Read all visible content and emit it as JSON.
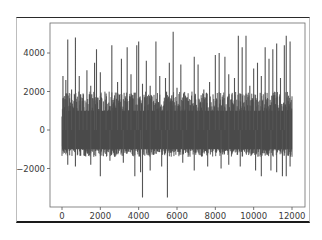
{
  "chart_data": {
    "type": "line",
    "title": "",
    "xlabel": "",
    "ylabel": "",
    "xlim": [
      -500,
      12500
    ],
    "ylim": [
      -3900,
      5400
    ],
    "grid": false,
    "legend": null,
    "x_ticks": [
      0,
      2000,
      4000,
      6000,
      8000,
      10000,
      12000
    ],
    "x_tick_labels": [
      "0",
      "2000",
      "4000",
      "6000",
      "8000",
      "10000",
      "12000"
    ],
    "y_ticks": [
      -2000,
      0,
      2000,
      4000
    ],
    "y_tick_labels": [
      "−2000",
      "0",
      "2000",
      "4000"
    ],
    "series": [
      {
        "name": "signal",
        "color": "#4a4a4a",
        "n_points": 12000,
        "x_range": [
          0,
          12000
        ],
        "typical_band": [
          -1000,
          1000
        ],
        "description": "Dense noisy time series centered near 0, band roughly -1000 to 1000 with frequent positive spikes to 2000-5000 and negative spikes to -2500 / -3500",
        "upper_spikes": [
          {
            "x": 50,
            "y": 2800
          },
          {
            "x": 200,
            "y": 2600
          },
          {
            "x": 300,
            "y": 4700
          },
          {
            "x": 500,
            "y": 2100
          },
          {
            "x": 700,
            "y": 4800
          },
          {
            "x": 900,
            "y": 2800
          },
          {
            "x": 1100,
            "y": 1900
          },
          {
            "x": 1300,
            "y": 3100
          },
          {
            "x": 1500,
            "y": 2300
          },
          {
            "x": 1700,
            "y": 3500
          },
          {
            "x": 1800,
            "y": 4200
          },
          {
            "x": 2000,
            "y": 3000
          },
          {
            "x": 2300,
            "y": 1900
          },
          {
            "x": 2600,
            "y": 4400
          },
          {
            "x": 2900,
            "y": 2500
          },
          {
            "x": 3100,
            "y": 3700
          },
          {
            "x": 3400,
            "y": 4300
          },
          {
            "x": 3600,
            "y": 2900
          },
          {
            "x": 3900,
            "y": 4400
          },
          {
            "x": 4000,
            "y": 4600
          },
          {
            "x": 4200,
            "y": 2400
          },
          {
            "x": 4400,
            "y": 3600
          },
          {
            "x": 4600,
            "y": 2300
          },
          {
            "x": 4900,
            "y": 4600
          },
          {
            "x": 5100,
            "y": 2800
          },
          {
            "x": 5400,
            "y": 2700
          },
          {
            "x": 5600,
            "y": 3500
          },
          {
            "x": 5800,
            "y": 5100
          },
          {
            "x": 6000,
            "y": 2200
          },
          {
            "x": 6200,
            "y": 3400
          },
          {
            "x": 6500,
            "y": 1600
          },
          {
            "x": 6900,
            "y": 3800
          },
          {
            "x": 7100,
            "y": 3400
          },
          {
            "x": 7400,
            "y": 2100
          },
          {
            "x": 7700,
            "y": 2500
          },
          {
            "x": 8000,
            "y": 3900
          },
          {
            "x": 8200,
            "y": 4000
          },
          {
            "x": 8500,
            "y": 3800
          },
          {
            "x": 8700,
            "y": 2900
          },
          {
            "x": 9000,
            "y": 2700
          },
          {
            "x": 9200,
            "y": 4900
          },
          {
            "x": 9400,
            "y": 4300
          },
          {
            "x": 9600,
            "y": 4900
          },
          {
            "x": 9800,
            "y": 2300
          },
          {
            "x": 10000,
            "y": 3200
          },
          {
            "x": 10200,
            "y": 3500
          },
          {
            "x": 10400,
            "y": 2800
          },
          {
            "x": 10600,
            "y": 4300
          },
          {
            "x": 10800,
            "y": 3700
          },
          {
            "x": 11000,
            "y": 4200
          },
          {
            "x": 11200,
            "y": 4500
          },
          {
            "x": 11400,
            "y": 2700
          },
          {
            "x": 11600,
            "y": 4400
          },
          {
            "x": 11700,
            "y": 4900
          },
          {
            "x": 11900,
            "y": 4600
          }
        ],
        "lower_spikes": [
          {
            "x": 300,
            "y": -1800
          },
          {
            "x": 700,
            "y": -1900
          },
          {
            "x": 1500,
            "y": -1800
          },
          {
            "x": 2000,
            "y": -2400
          },
          {
            "x": 2500,
            "y": -1600
          },
          {
            "x": 3200,
            "y": -1700
          },
          {
            "x": 3800,
            "y": -2400
          },
          {
            "x": 4100,
            "y": -2200
          },
          {
            "x": 4200,
            "y": -3500
          },
          {
            "x": 4600,
            "y": -2100
          },
          {
            "x": 5200,
            "y": -1900
          },
          {
            "x": 5500,
            "y": -3500
          },
          {
            "x": 6300,
            "y": -1700
          },
          {
            "x": 6900,
            "y": -2100
          },
          {
            "x": 7600,
            "y": -1900
          },
          {
            "x": 8300,
            "y": -2000
          },
          {
            "x": 8700,
            "y": -1800
          },
          {
            "x": 9300,
            "y": -1900
          },
          {
            "x": 10100,
            "y": -2100
          },
          {
            "x": 10400,
            "y": -2400
          },
          {
            "x": 10900,
            "y": -2100
          },
          {
            "x": 11200,
            "y": -2200
          },
          {
            "x": 11500,
            "y": -2400
          },
          {
            "x": 11700,
            "y": -2400
          },
          {
            "x": 11900,
            "y": -1900
          }
        ]
      }
    ]
  },
  "axes": {
    "x_labels": [
      "0",
      "2000",
      "4000",
      "6000",
      "8000",
      "10000",
      "12000"
    ],
    "y_labels": [
      "−2000",
      "0",
      "2000",
      "4000"
    ]
  }
}
